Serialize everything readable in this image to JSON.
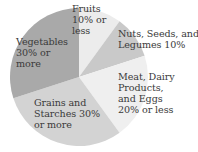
{
  "chart_data": {
    "type": "pie",
    "title": "",
    "slices": [
      {
        "label": "Fruits 10% or less",
        "value": 10,
        "color": "#ececec"
      },
      {
        "label": "Nuts, Seeds, and Legumes 10%",
        "value": 10,
        "color": "#c9c9c9"
      },
      {
        "label": "Meat, Dairy Products, and Eggs 20% or less",
        "value": 20,
        "color": "#efefef"
      },
      {
        "label": "Grains and Starches 30% or more",
        "value": 30,
        "color": "#d3d3d3"
      },
      {
        "label": "Vegetables 30% or more",
        "value": 30,
        "color": "#a9a9a9"
      }
    ],
    "start_angle": "12 o'clock, clockwise",
    "legend": "none (labels inside slices)"
  },
  "labels": {
    "fruits": "Fruits\n10% or\nless",
    "nuts": "Nuts, Seeds, and\nLegumes 10%",
    "meat": "Meat, Dairy\nProducts,\nand Eggs\n20% or less",
    "grains": "Grains and\nStarches 30%\nor more",
    "vegetables": "Vegetables\n30% or\nmore"
  }
}
